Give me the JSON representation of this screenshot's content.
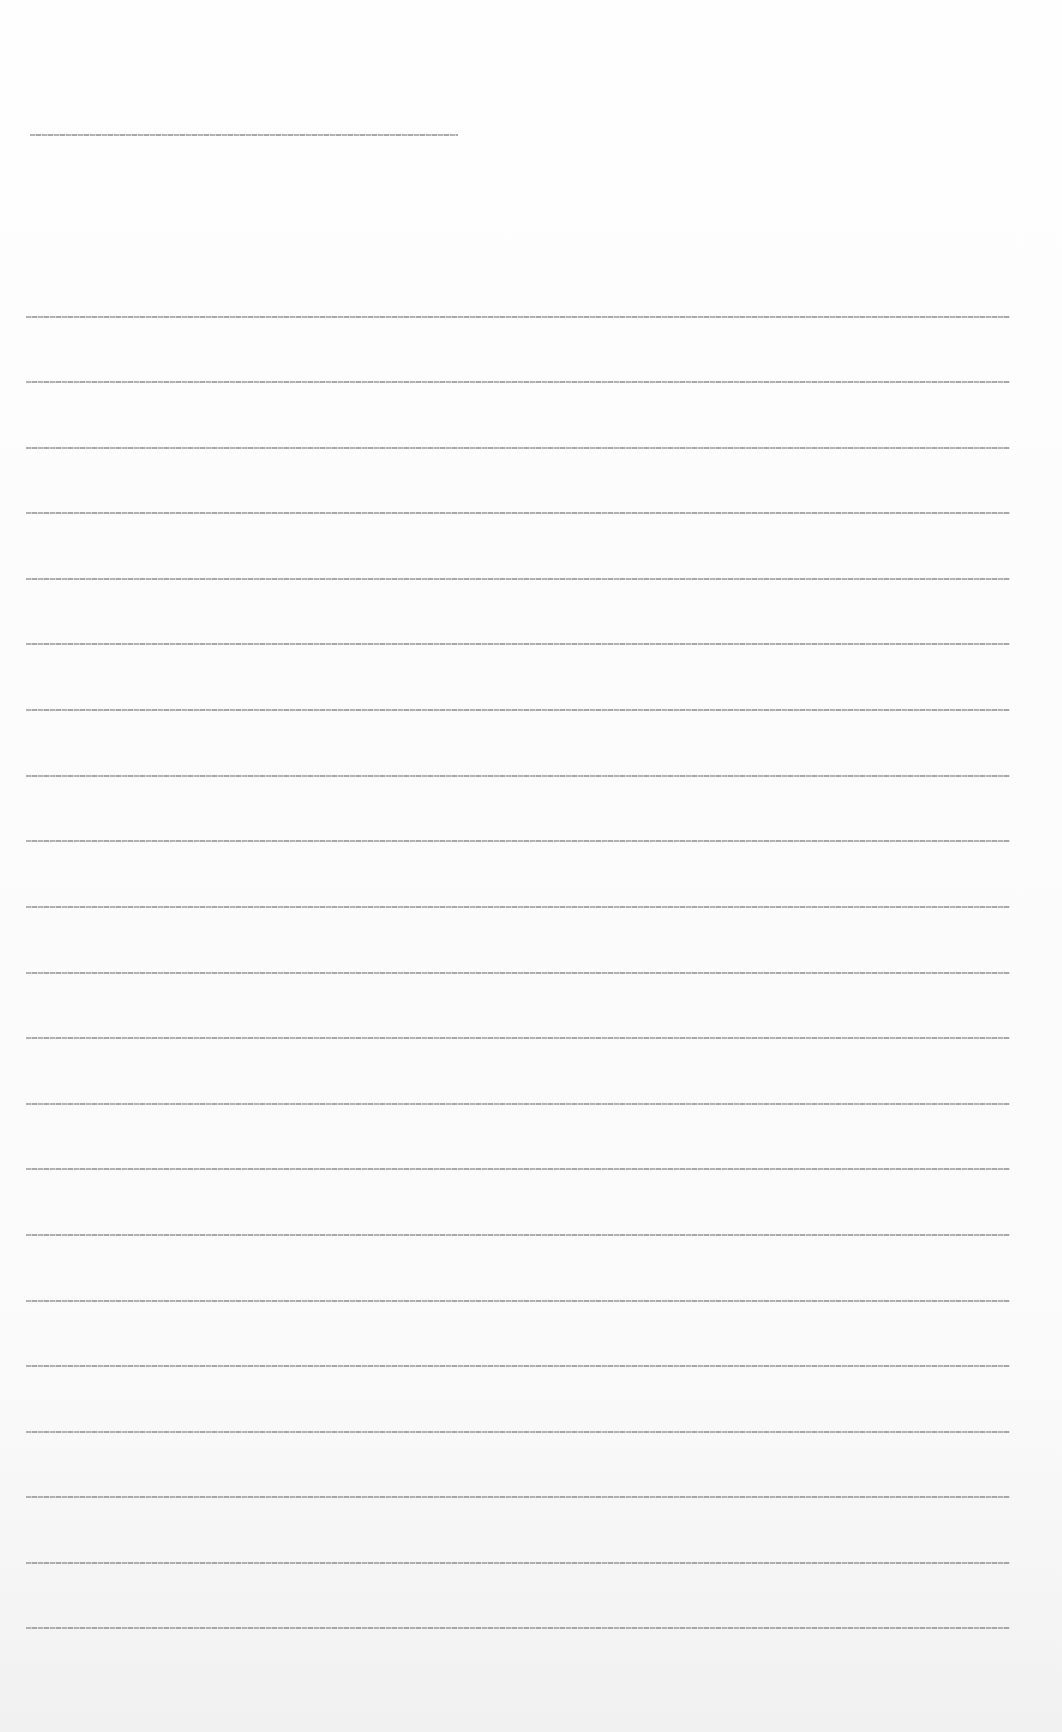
{
  "document": {
    "legibility": "illegible — text rendered at ~1px height",
    "heading_line": {
      "text": "",
      "x": 30,
      "y": 134,
      "width": 428
    },
    "body_lines": [
      {
        "text": "",
        "y": 316
      },
      {
        "text": "",
        "y": 381
      },
      {
        "text": "",
        "y": 447
      },
      {
        "text": "",
        "y": 512
      },
      {
        "text": "",
        "y": 578
      },
      {
        "text": "",
        "y": 643
      },
      {
        "text": "",
        "y": 709
      },
      {
        "text": "",
        "y": 775
      },
      {
        "text": "",
        "y": 840
      },
      {
        "text": "",
        "y": 906
      },
      {
        "text": "",
        "y": 972
      },
      {
        "text": "",
        "y": 1037
      },
      {
        "text": "",
        "y": 1103
      },
      {
        "text": "",
        "y": 1168
      },
      {
        "text": "",
        "y": 1234
      },
      {
        "text": "",
        "y": 1300
      },
      {
        "text": "",
        "y": 1365
      },
      {
        "text": "",
        "y": 1431
      },
      {
        "text": "",
        "y": 1496
      },
      {
        "text": "",
        "y": 1562
      },
      {
        "text": "",
        "y": 1627
      }
    ],
    "body_line_x": 26,
    "body_line_width": 984
  }
}
